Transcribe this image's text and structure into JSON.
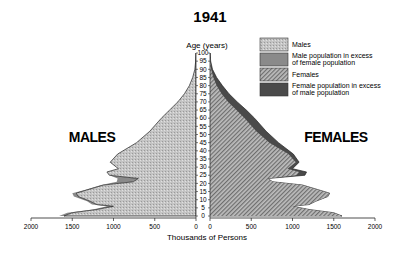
{
  "chart_data": {
    "type": "area",
    "subtype": "population-pyramid",
    "title": "1941",
    "ylabel": "Age (years)",
    "xlabel": "Thousands of Persons",
    "side_labels": {
      "left": "MALES",
      "right": "FEMALES"
    },
    "x_ticks": [
      2000,
      1500,
      1000,
      500,
      0,
      0,
      500,
      1000,
      1500,
      2000
    ],
    "xlim": [
      0,
      2000
    ],
    "y_ticks": [
      0,
      5,
      10,
      15,
      20,
      25,
      30,
      35,
      40,
      45,
      50,
      55,
      60,
      65,
      70,
      75,
      80,
      85,
      90,
      95,
      100
    ],
    "ylim": [
      0,
      100
    ],
    "legend": [
      {
        "label": "Males",
        "pattern": "light-stipple"
      },
      {
        "label": "Male population in excess of female population",
        "pattern": "medium-gray"
      },
      {
        "label": "Females",
        "pattern": "diagonal-hatch"
      },
      {
        "label": "Female population in excess of male population",
        "pattern": "dark-gray"
      }
    ],
    "legend_position": "upper-right",
    "series": [
      {
        "name": "Males",
        "ages": [
          0,
          2,
          4,
          6,
          7,
          9,
          12,
          14,
          16,
          19,
          21,
          23,
          25,
          27,
          29,
          33,
          38,
          45,
          52,
          60,
          65,
          70,
          75,
          80,
          85,
          90,
          95,
          100
        ],
        "values": [
          1660,
          1560,
          1250,
          1080,
          1260,
          1320,
          1480,
          1500,
          1350,
          1150,
          960,
          950,
          1050,
          1080,
          940,
          1040,
          950,
          720,
          560,
          420,
          320,
          220,
          140,
          80,
          40,
          14,
          4,
          0
        ]
      },
      {
        "name": "Females",
        "ages": [
          0,
          2,
          4,
          6,
          7,
          9,
          12,
          14,
          16,
          19,
          21,
          23,
          25,
          27,
          29,
          33,
          38,
          45,
          52,
          60,
          65,
          70,
          75,
          80,
          85,
          90,
          95,
          100
        ],
        "values": [
          1600,
          1500,
          1200,
          1000,
          1200,
          1280,
          1430,
          1450,
          1320,
          1120,
          760,
          700,
          1150,
          1170,
          1000,
          1080,
          1010,
          830,
          680,
          540,
          440,
          330,
          230,
          150,
          80,
          30,
          8,
          0
        ]
      }
    ]
  }
}
